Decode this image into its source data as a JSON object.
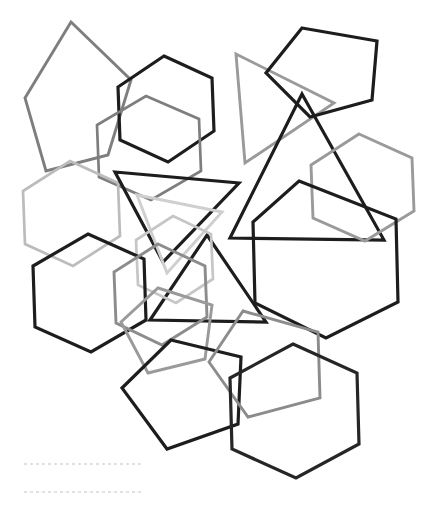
{
  "canvas": {
    "width": 430,
    "height": 520,
    "background": "#ffffff",
    "title": "overlapping-polygon-outline-composition"
  },
  "palette": {
    "black": "#1d1d1d",
    "dark_gray": "#565656",
    "mid_gray": "#7e7e7e",
    "gray": "#9a9a9a",
    "light_gray": "#bcbcbc",
    "pale_gray": "#d2d2d2",
    "dash_gray": "#d8d8d8",
    "background": "#ffffff"
  },
  "stroke_widths": {
    "heavy": 3.2,
    "normal": 2.9,
    "light": 2.7,
    "dash": 1.6
  },
  "shapes": [
    {
      "id": "pentagon-top-left-gray",
      "kind": "pentagon",
      "color": "#7e7e7e",
      "width": 2.9,
      "points": "71,22 131,80 108,155 46,171 25,98"
    },
    {
      "id": "hexagon-top-center-black",
      "kind": "hexagon",
      "color": "#1d1d1d",
      "width": 3.2,
      "points": "164,56 212,78 214,131 168,162 120,140 118,87"
    },
    {
      "id": "hexagon-upper-left-gray",
      "kind": "hexagon",
      "color": "#7e7e7e",
      "width": 2.7,
      "points": "146,96 199,119 201,171 151,200 99,177 97,125"
    },
    {
      "id": "hexagon-left-lightgray",
      "kind": "hexagon",
      "color": "#bcbcbc",
      "width": 2.7,
      "points": "70,161 118,183 120,236 73,266 25,244 23,191"
    },
    {
      "id": "triangle-top-center-gray",
      "kind": "triangle",
      "color": "#9a9a9a",
      "width": 2.9,
      "points": "236,54 334,103 245,163"
    },
    {
      "id": "pentagon-top-right-black",
      "kind": "pentagon",
      "color": "#1d1d1d",
      "width": 3.2,
      "points": "302,28 377,41 372,100 310,117 266,73"
    },
    {
      "id": "triangle-big-right-black",
      "kind": "triangle",
      "color": "#1d1d1d",
      "width": 3.2,
      "points": "302,94 384,240 230,238"
    },
    {
      "id": "hexagon-right-gray",
      "kind": "hexagon",
      "color": "#9a9a9a",
      "width": 2.9,
      "points": "359,134 412,158 414,211 365,241 313,218 311,165"
    },
    {
      "id": "triangle-center-left-black",
      "kind": "triangle",
      "color": "#1d1d1d",
      "width": 3.2,
      "points": "115,172 239,183 163,262"
    },
    {
      "id": "triangle-center-light",
      "kind": "triangle",
      "color": "#cfcfcf",
      "width": 2.9,
      "points": "137,195 222,212 167,273"
    },
    {
      "id": "triangle-center-up-black",
      "kind": "triangle",
      "color": "#1d1d1d",
      "width": 3.2,
      "points": "207,235 266,322 150,320"
    },
    {
      "id": "hexagon-mid-right-black",
      "kind": "hexagon",
      "color": "#1d1d1d",
      "width": 3.2,
      "points": "299,181 396,219 398,302 326,338 255,303 253,222"
    },
    {
      "id": "hexagon-center-lightgray",
      "kind": "hexagon",
      "color": "#c6c6c6",
      "width": 2.7,
      "points": "173,216 211,234 213,279 176,303 138,285 136,240"
    },
    {
      "id": "hexagon-lower-left-black",
      "kind": "hexagon",
      "color": "#1d1d1d",
      "width": 3.2,
      "points": "88,234 144,259 146,320 91,352 35,327 33,266"
    },
    {
      "id": "hexagon-bottom-center-gray",
      "kind": "hexagon",
      "color": "#8c8c8c",
      "width": 2.9,
      "points": "158,244 205,266 207,317 162,345 116,323 114,272"
    },
    {
      "id": "pentagon-bottom-left-gray",
      "kind": "pentagon",
      "color": "#9a9a9a",
      "width": 2.9,
      "points": "158,288 212,305 205,359 148,373 121,322"
    },
    {
      "id": "pentagon-bottom-center-black",
      "kind": "pentagon",
      "color": "#1d1d1d",
      "width": 3.2,
      "points": "171,340 241,357 238,424 167,449 122,388"
    },
    {
      "id": "pentagon-bottom-right-gray",
      "kind": "pentagon",
      "color": "#8c8c8c",
      "width": 2.9,
      "points": "243,311 318,332 320,398 248,417 209,362"
    },
    {
      "id": "hexagon-bottom-right-black",
      "kind": "hexagon",
      "color": "#262626",
      "width": 3.2,
      "points": "293,344 357,373 359,444 296,478 232,449 230,378"
    }
  ],
  "dashed_lines": [
    {
      "id": "dash-line-1",
      "color": "#d8d8d8",
      "width": 1.6,
      "dash": "3 3",
      "x1": 24,
      "y1": 464,
      "x2": 142,
      "y2": 464
    },
    {
      "id": "dash-line-2",
      "color": "#d8d8d8",
      "width": 1.6,
      "dash": "3 3",
      "x1": 24,
      "y1": 492,
      "x2": 142,
      "y2": 492
    }
  ]
}
